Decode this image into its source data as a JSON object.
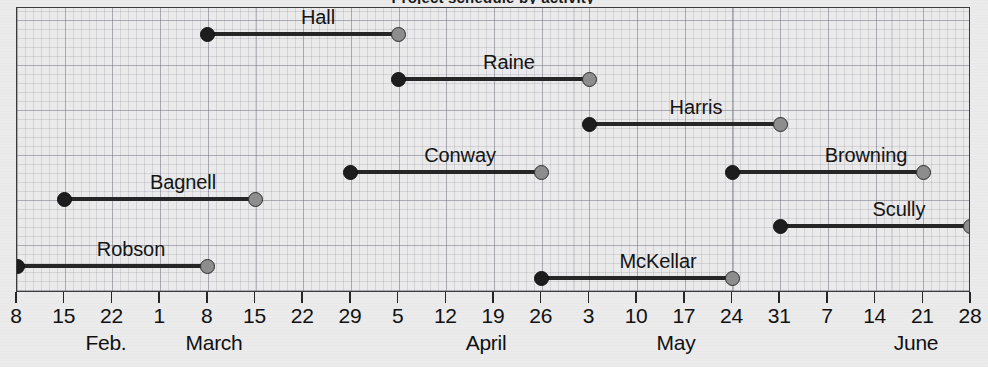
{
  "chart_data": {
    "type": "bar",
    "subtype": "gantt",
    "title": "Project schedule by activity",
    "xlabel": "",
    "ylabel": "",
    "grid": true,
    "legend": "none",
    "x_axis": {
      "min_label": "8",
      "max_label": "28",
      "tick_labels": [
        "8",
        "15",
        "22",
        "1",
        "8",
        "15",
        "22",
        "29",
        "5",
        "12",
        "19",
        "26",
        "3",
        "10",
        "17",
        "24",
        "31",
        "7",
        "14",
        "21",
        "28"
      ],
      "month_labels": [
        "Feb.",
        "March",
        "April",
        "May",
        "June"
      ]
    },
    "categories": [
      "Hall",
      "Raine",
      "Harris",
      "Conway",
      "Browning",
      "Bagnell",
      "Scully",
      "Robson",
      "McKellar"
    ],
    "tasks": [
      {
        "name": "Hall",
        "start": "March 8",
        "end": "April 5",
        "start_week_index": 4,
        "end_week_index": 8,
        "duration_weeks": 4
      },
      {
        "name": "Raine",
        "start": "April 5",
        "end": "May 3",
        "start_week_index": 8,
        "end_week_index": 12,
        "duration_weeks": 4
      },
      {
        "name": "Harris",
        "start": "May 3",
        "end": "May 31",
        "start_week_index": 12,
        "end_week_index": 16,
        "duration_weeks": 4
      },
      {
        "name": "Conway",
        "start": "March 29",
        "end": "April 26",
        "start_week_index": 7,
        "end_week_index": 11,
        "duration_weeks": 4
      },
      {
        "name": "Browning",
        "start": "May 24",
        "end": "June 21",
        "start_week_index": 15,
        "end_week_index": 19,
        "duration_weeks": 4
      },
      {
        "name": "Bagnell",
        "start": "February 15",
        "end": "March 15",
        "start_week_index": 1,
        "end_week_index": 5,
        "duration_weeks": 4
      },
      {
        "name": "Scully",
        "start": "May 31",
        "end": "June 28",
        "start_week_index": 16,
        "end_week_index": 20,
        "duration_weeks": 4
      },
      {
        "name": "Robson",
        "start": "February 8",
        "end": "March 8",
        "start_week_index": 0,
        "end_week_index": 4,
        "duration_weeks": 4
      },
      {
        "name": "McKellar",
        "start": "April 26",
        "end": "May 24",
        "start_week_index": 11,
        "end_week_index": 15,
        "duration_weeks": 4
      }
    ],
    "markers": {
      "start_marker": "filled-black-circle",
      "end_marker": "gray-circle"
    },
    "colors": {
      "line": "#262626",
      "start_dot": "#1d1d1d",
      "end_dot": "#8d8d8d",
      "grid": "#8a8a99",
      "background": "#eaeaeb",
      "text": "#111111"
    }
  },
  "layout": {
    "rows": [
      {
        "label": "Hall",
        "y": 26,
        "label_x": 301,
        "label_anchor": "center"
      },
      {
        "label": "Raine",
        "y": 71,
        "label_x": 492,
        "label_anchor": "center"
      },
      {
        "label": "Harris",
        "y": 116,
        "label_x": 679,
        "label_anchor": "center"
      },
      {
        "label": "Conway",
        "y": 164,
        "label_x": 443,
        "label_anchor": "center"
      },
      {
        "label": "Browning",
        "y": 164,
        "label_x": 849,
        "label_anchor": "center"
      },
      {
        "label": "Bagnell",
        "y": 191,
        "label_x": 166,
        "label_anchor": "center"
      },
      {
        "label": "Scully",
        "y": 218,
        "label_x": 882,
        "label_anchor": "center"
      },
      {
        "label": "Robson",
        "y": 258,
        "label_x": 114,
        "label_anchor": "center"
      },
      {
        "label": "McKellar",
        "y": 270,
        "label_x": 641,
        "label_anchor": "center"
      }
    ],
    "month_positions": [
      {
        "label": "Feb.",
        "x": 90
      },
      {
        "label": "March",
        "x": 198
      },
      {
        "label": "April",
        "x": 470
      },
      {
        "label": "May",
        "x": 660
      },
      {
        "label": "June",
        "x": 900
      }
    ]
  }
}
